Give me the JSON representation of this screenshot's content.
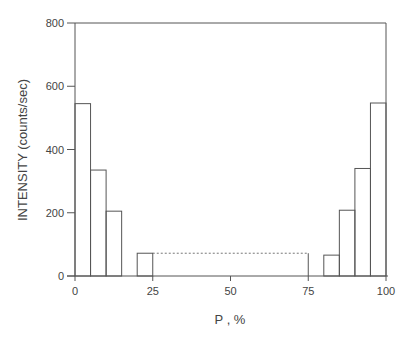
{
  "chart_data": {
    "type": "bar",
    "title": "",
    "xlabel": "P , %",
    "ylabel": "INTENSITY (counts/sec)",
    "xlim": [
      0,
      100
    ],
    "ylim": [
      0,
      800
    ],
    "xticks": [
      0,
      25,
      50,
      75,
      100
    ],
    "yticks": [
      0,
      200,
      400,
      600,
      800
    ],
    "grid": false,
    "legend": null,
    "bin_width": 5,
    "bins": [
      {
        "x0": 0,
        "x1": 5,
        "value": 545
      },
      {
        "x0": 5,
        "x1": 10,
        "value": 335
      },
      {
        "x0": 10,
        "x1": 15,
        "value": 205
      },
      {
        "x0": 15,
        "x1": 20,
        "value": 0
      },
      {
        "x0": 20,
        "x1": 25,
        "value": 72
      },
      {
        "x0": 80,
        "x1": 85,
        "value": 66
      },
      {
        "x0": 85,
        "x1": 90,
        "value": 208
      },
      {
        "x0": 90,
        "x1": 95,
        "value": 340
      },
      {
        "x0": 95,
        "x1": 100,
        "value": 547
      }
    ],
    "annotations": [
      {
        "type": "dotted-line",
        "from_x": 25,
        "to_x": 75,
        "y": 72,
        "description": "dotted continuation between 25 and 75"
      },
      {
        "type": "vertical-line",
        "x": 75,
        "from_y": 0,
        "to_y": 72
      }
    ]
  },
  "labels": {
    "xlabel": "P , %",
    "ylabel": "INTENSITY (counts/sec)",
    "xticks": [
      "0",
      "25",
      "50",
      "75",
      "100"
    ],
    "yticks": [
      "0",
      "200",
      "400",
      "600",
      "800"
    ]
  }
}
